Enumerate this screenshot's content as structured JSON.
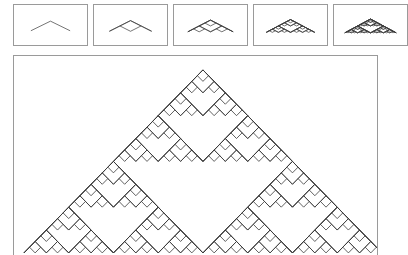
{
  "app": {
    "background_color": "#ffffff",
    "border_color": "#9a9a9a",
    "stroke_color": "#3a3a3a"
  },
  "thumbnail_strip": {
    "name": "iteration-preview-strip",
    "cell_count": 5,
    "cells": [
      {
        "index": 0,
        "label": "iteration-0",
        "depth": 1,
        "x": 0,
        "width": 75
      },
      {
        "index": 1,
        "label": "iteration-1",
        "depth": 2,
        "x": 80,
        "width": 75
      },
      {
        "index": 2,
        "label": "iteration-2",
        "depth": 3,
        "x": 160,
        "width": 75
      },
      {
        "index": 3,
        "label": "iteration-3",
        "depth": 4,
        "x": 240,
        "width": 75
      },
      {
        "index": 4,
        "label": "iteration-4",
        "depth": 5,
        "x": 320,
        "width": 75
      }
    ]
  },
  "main_panel": {
    "name": "fractal-canvas-panel",
    "figure_name": "sierpinski-arrowhead-chevron-fractal",
    "depth": 6,
    "apex_x": 190,
    "apex_y": 14,
    "base_y": 198,
    "half_width": 180
  }
}
